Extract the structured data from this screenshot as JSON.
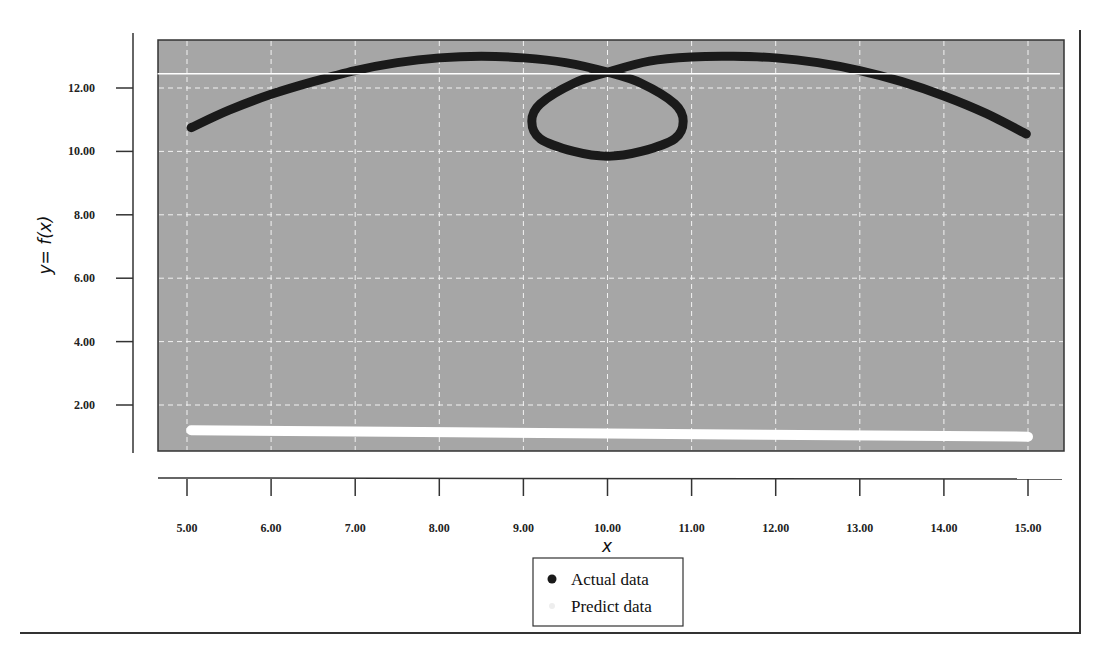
{
  "chart_data": {
    "type": "line",
    "title": "",
    "xlabel": "x",
    "ylabel": "y= f(x)",
    "xlim": [
      4.6,
      15.4
    ],
    "ylim": [
      0.55,
      13.5
    ],
    "x_ticks": [
      "5.00",
      "6.00",
      "7.00",
      "8.00",
      "9.00",
      "10.00",
      "11.00",
      "12.00",
      "13.00",
      "14.00",
      "15.00"
    ],
    "y_ticks": [
      "2.00",
      "4.00",
      "6.00",
      "8.00",
      "10.00",
      "12.00"
    ],
    "grid": true,
    "grid_style": "dashed-white",
    "plot_background": "#a6a6a6",
    "legend_position": "bottom-center",
    "legend": [
      {
        "label": "Actual data",
        "marker": "dot",
        "color": "#1a1a1a"
      },
      {
        "label": "Predict data",
        "marker": "dot",
        "color": "#ffffff"
      }
    ],
    "series": [
      {
        "name": "Actual data",
        "color": "#1a1a1a",
        "x": [
          5.05,
          5.5,
          6.0,
          6.5,
          7.0,
          7.5,
          8.0,
          8.5,
          9.0,
          9.5,
          10.0,
          10.4,
          10.8,
          10.9,
          10.8,
          10.4,
          10.0,
          9.6,
          9.2,
          9.1,
          9.2,
          9.6,
          10.0,
          10.5,
          11.0,
          11.5,
          12.0,
          12.5,
          13.0,
          13.5,
          14.0,
          14.5,
          14.98
        ],
        "y": [
          10.75,
          11.3,
          11.8,
          12.2,
          12.55,
          12.8,
          12.95,
          13.0,
          12.95,
          12.8,
          12.5,
          12.15,
          11.5,
          10.95,
          10.4,
          10.0,
          9.85,
          10.0,
          10.4,
          10.95,
          11.5,
          12.15,
          12.5,
          12.85,
          12.98,
          13.0,
          12.95,
          12.8,
          12.55,
          12.2,
          11.75,
          11.2,
          10.55
        ]
      },
      {
        "name": "Predict data",
        "color": "#ffffff",
        "x": [
          5.05,
          10.0,
          15.0
        ],
        "y": [
          1.2,
          1.1,
          1.0
        ]
      },
      {
        "name": "reference-line",
        "color": "#ffffff",
        "x": [
          4.6,
          15.4
        ],
        "y": [
          12.45,
          12.45
        ]
      }
    ]
  }
}
